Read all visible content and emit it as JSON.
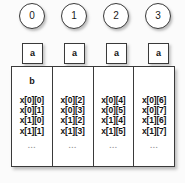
{
  "diagram": {
    "background_color": "#fbfbfb",
    "line_color": "#3a3a3a",
    "text_color": "#131313",
    "ellipsis_color": "#9a9a9a",
    "ellipsis": "...",
    "banks": [
      {
        "index_label": "0",
        "address_label": "a",
        "base_label": "b",
        "cells": [
          "x[0][0]",
          "x[0][1]",
          "x[1][0]",
          "x[1][1]"
        ]
      },
      {
        "index_label": "1",
        "address_label": "a",
        "base_label": "",
        "cells": [
          "x[0][2]",
          "x[0][3]",
          "x[1][2]",
          "x[1][3]"
        ]
      },
      {
        "index_label": "2",
        "address_label": "a",
        "base_label": "",
        "cells": [
          "x[0][4]",
          "x[0][5]",
          "x[1][4]",
          "x[1][5]"
        ]
      },
      {
        "index_label": "3",
        "address_label": "a",
        "base_label": "",
        "cells": [
          "x[0][6]",
          "x[0][7]",
          "x[1][6]",
          "x[1][7]"
        ]
      }
    ]
  }
}
